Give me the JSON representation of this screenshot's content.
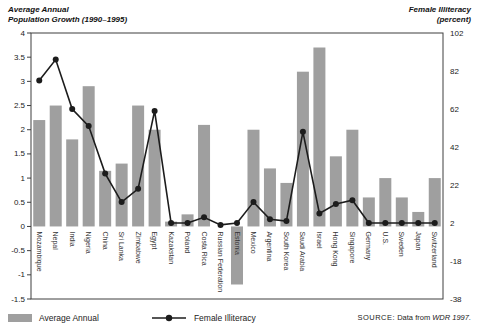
{
  "header": {
    "left_title_line1": "Average Annual",
    "left_title_line2": "Population Growth (1990–1995)",
    "right_title_line1": "Female Illiteracy",
    "right_title_line2": "(percent)"
  },
  "legend": {
    "bar_label": "Average Annual",
    "line_label": "Female Illiteracy"
  },
  "source": {
    "prefix": "SOURCE:",
    "text": "Data from",
    "cite": "WDR 1997."
  },
  "colors": {
    "bar": "#9f9f9f",
    "line": "#1c1c1c",
    "axis": "#3f3f3f",
    "tick_text": "#222222",
    "category_text": "#333333"
  },
  "chart_data": {
    "type": "bar",
    "categories": [
      "Mozambique",
      "Nepal",
      "India",
      "Nigeria",
      "China",
      "Sri Lanka",
      "Zimbabwe",
      "Egypt",
      "Kazakstan",
      "Poland",
      "Costa Rica",
      "Russian Federation",
      "Estonia",
      "Mexico",
      "Argentina",
      "South Korea",
      "Saudi Arabia",
      "Israel",
      "Hong Kong",
      "Singapore",
      "Germany",
      "U.S.",
      "Sweden",
      "Japan",
      "Switzerland"
    ],
    "series": [
      {
        "name": "Average Annual",
        "type": "bar",
        "axis": "left",
        "values": [
          2.2,
          2.5,
          1.8,
          2.9,
          1.15,
          1.3,
          2.5,
          2.0,
          0.1,
          0.25,
          2.1,
          0,
          -1.2,
          2.0,
          1.2,
          0.9,
          3.2,
          3.7,
          1.45,
          2.0,
          0.6,
          1.0,
          0.6,
          0.3,
          1.0
        ]
      },
      {
        "name": "Female Illiteracy",
        "type": "line",
        "axis": "right",
        "values": [
          77,
          88,
          62,
          53,
          28,
          13,
          20,
          61,
          2,
          2,
          5,
          1,
          2,
          13,
          4,
          3,
          50,
          7,
          12,
          14,
          2,
          2,
          2,
          2,
          2
        ]
      }
    ],
    "left_axis": {
      "label": "Average Annual Population Growth (1990–1995)",
      "min": -1.5,
      "max": 4,
      "tick_step": 0.5,
      "tick_labels": [
        "4",
        "3.5",
        "3",
        "2.5",
        "2",
        "1.5",
        "1",
        "0.5",
        "0",
        "-0.5",
        "-1",
        "-1.5"
      ]
    },
    "right_axis": {
      "label": "Female Illiteracy (percent)",
      "min": -38,
      "max": 102,
      "tick_step": 20,
      "tick_labels": [
        "102",
        "82",
        "62",
        "42",
        "22",
        "2",
        "-18",
        "-38"
      ]
    },
    "grid": false,
    "legend_position": "bottom"
  }
}
